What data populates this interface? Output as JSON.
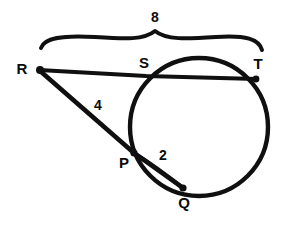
{
  "diagram": {
    "type": "circle-secant-geometry",
    "background_color": "#ffffff",
    "ink_color": "#101010",
    "circle": {
      "center_x": 199,
      "center_y": 127,
      "radius": 69
    },
    "points": [
      {
        "id": "R",
        "label": "R",
        "x": 39,
        "y": 70,
        "label_x": 22,
        "label_y": 70,
        "has_dot": true
      },
      {
        "id": "S",
        "label": "S",
        "x": 146,
        "y": 76,
        "label_x": 144,
        "label_y": 64,
        "has_dot": false
      },
      {
        "id": "T",
        "label": "T",
        "x": 257,
        "y": 79,
        "label_x": 258,
        "label_y": 65,
        "has_dot": true
      },
      {
        "id": "P",
        "label": "P",
        "x": 134,
        "y": 153,
        "label_x": 124,
        "label_y": 164,
        "has_dot": true
      },
      {
        "id": "Q",
        "label": "Q",
        "x": 183,
        "y": 188,
        "label_x": 184,
        "label_y": 204,
        "has_dot": true
      }
    ],
    "segments": [
      {
        "id": "RT",
        "from": "R",
        "to": "T",
        "description": "secant through S and T"
      },
      {
        "id": "RQ",
        "from": "R",
        "to": "Q",
        "description": "secant through P and Q"
      },
      {
        "id": "PQ",
        "from": "P",
        "to": "Q",
        "description": "chord arc from P to Q"
      }
    ],
    "measures": [
      {
        "id": "ST-brace",
        "value": "8",
        "label_x": 155,
        "label_y": 18,
        "segment": "ST",
        "style": "brace"
      },
      {
        "id": "RP",
        "value": "4",
        "label_x": 98,
        "label_y": 106,
        "segment": "RP",
        "style": "inline"
      },
      {
        "id": "PQ",
        "value": "2",
        "label_x": 163,
        "label_y": 156,
        "segment": "PQ",
        "style": "inline"
      }
    ],
    "brace": {
      "left_x": 41,
      "right_x": 262,
      "baseline_y": 44,
      "peak_x": 155,
      "peak_y": 31
    }
  }
}
